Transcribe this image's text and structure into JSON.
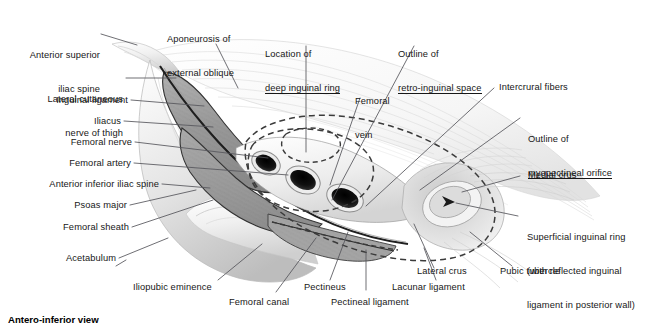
{
  "figure": {
    "domain": "anatomical-illustration",
    "caption": "Antero-inferior view",
    "background_color": "#ffffff",
    "text_color": "#171717",
    "leader_line_color": "#55555b",
    "region": "inguinal region / myopectineal orifice",
    "view": "antero-inferior"
  },
  "labels_left": [
    {
      "id": "anterior-superior-iliac-spine",
      "line1": "Anterior superior",
      "line2": "iliac spine",
      "underline": false
    },
    {
      "id": "lateral-cutaneous-nerve-of-thigh",
      "line1": "Lateral cutaneous",
      "line2": "nerve of thigh",
      "underline": false
    },
    {
      "id": "inguinal-ligament",
      "line1": "Inguinal ligament",
      "line2": "",
      "underline": false
    },
    {
      "id": "iliacus",
      "line1": "Iliacus",
      "line2": "",
      "underline": false
    },
    {
      "id": "femoral-nerve",
      "line1": "Femoral nerve",
      "line2": "",
      "underline": false
    },
    {
      "id": "femoral-artery",
      "line1": "Femoral artery",
      "line2": "",
      "underline": false
    },
    {
      "id": "anterior-inferior-iliac-spine",
      "line1": "Anterior inferior iliac spine",
      "line2": "",
      "underline": false
    },
    {
      "id": "psoas-major",
      "line1": "Psoas major",
      "line2": "",
      "underline": false
    },
    {
      "id": "femoral-sheath",
      "line1": "Femoral sheath",
      "line2": "",
      "underline": false
    },
    {
      "id": "acetabulum",
      "line1": "Acetabulum",
      "line2": "",
      "underline": false
    }
  ],
  "labels_top": [
    {
      "id": "aponeurosis-of-external-oblique",
      "line1": "Aponeurosis of",
      "line2": "external oblique",
      "underline": false
    },
    {
      "id": "location-of-deep-inguinal-ring",
      "line1": "Location of",
      "line2": "deep inguinal ring",
      "underline": true
    },
    {
      "id": "outline-of-retro-inguinal-space",
      "line1": "Outline of",
      "line2": "retro-inguinal space",
      "underline": true
    },
    {
      "id": "femoral-vein",
      "line1": "Femoral",
      "line2": "vein",
      "underline": false
    }
  ],
  "labels_right": [
    {
      "id": "intercrural-fibers",
      "line1": "Intercrural fibers",
      "line2": "",
      "line3": "",
      "underline": false
    },
    {
      "id": "outline-of-myopectineal-orifice",
      "line1": "Outline of",
      "line2": "myopectineal orifice",
      "line3": "",
      "underline": true
    },
    {
      "id": "medial-crus",
      "line1": "Medial crus",
      "line2": "",
      "line3": "",
      "underline": false
    },
    {
      "id": "superficial-inguinal-ring",
      "line1": "Superficial inguinal ring",
      "line2": "(with reflected inguinal",
      "line3": "ligament in posterior wall)",
      "underline": false
    }
  ],
  "labels_bottom": [
    {
      "id": "iliopubic-eminence",
      "text": "Iliopubic eminence"
    },
    {
      "id": "femoral-canal",
      "text": "Femoral canal"
    },
    {
      "id": "pectineus",
      "text": "Pectineus"
    },
    {
      "id": "pectineal-ligament",
      "text": "Pectineal ligament"
    },
    {
      "id": "lacunar-ligament",
      "text": "Lacunar ligament"
    },
    {
      "id": "lateral-crus",
      "text": "Lateral crus"
    },
    {
      "id": "pubic-tubercle",
      "text": "Pubic tubercle"
    }
  ]
}
